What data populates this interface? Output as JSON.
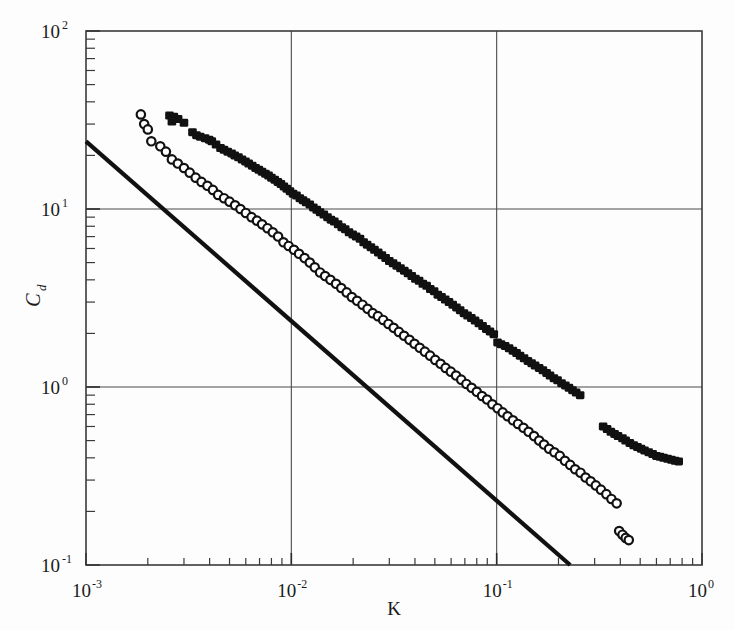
{
  "chart_data": {
    "type": "scatter",
    "title": "",
    "xlabel": "K",
    "ylabel": "Cd",
    "ylabel_base": "C",
    "ylabel_sub": "d",
    "xscale": "log",
    "yscale": "log",
    "xlim": [
      0.001,
      1.0
    ],
    "ylim": [
      0.1,
      100
    ],
    "grid": true,
    "grid_x_values": [
      0.01,
      0.1
    ],
    "grid_y_values": [
      10,
      1
    ],
    "legend": "none",
    "xticks": [
      {
        "value": 0.001,
        "base": "10",
        "exp": "-3"
      },
      {
        "value": 0.01,
        "base": "10",
        "exp": "-2"
      },
      {
        "value": 0.1,
        "base": "10",
        "exp": "-1"
      },
      {
        "value": 1.0,
        "base": "10",
        "exp": "0"
      }
    ],
    "yticks": [
      {
        "value": 100,
        "base": "10",
        "exp": "2"
      },
      {
        "value": 10,
        "base": "10",
        "exp": "1"
      },
      {
        "value": 1,
        "base": "10",
        "exp": "0"
      },
      {
        "value": 0.1,
        "base": "10",
        "exp": "-1"
      }
    ],
    "series": [
      {
        "name": "filled-squares",
        "marker": "filled-square",
        "color": "#111111",
        "points": [
          [
            0.00255,
            33.5
          ],
          [
            0.00268,
            33.0
          ],
          [
            0.00281,
            32.0
          ],
          [
            0.00262,
            31.0
          ],
          [
            0.003,
            30.5
          ],
          [
            0.0033,
            27.0
          ],
          [
            0.00345,
            26.0
          ],
          [
            0.0036,
            25.5
          ],
          [
            0.0038,
            25.0
          ],
          [
            0.00398,
            24.5
          ],
          [
            0.0041,
            24.0
          ],
          [
            0.0043,
            23.0
          ],
          [
            0.00452,
            22.0
          ],
          [
            0.0047,
            21.5
          ],
          [
            0.0049,
            21.0
          ],
          [
            0.00512,
            20.5
          ],
          [
            0.0053,
            20.0
          ],
          [
            0.00553,
            19.5
          ],
          [
            0.00575,
            19.0
          ],
          [
            0.00598,
            18.5
          ],
          [
            0.0062,
            18.0
          ],
          [
            0.00645,
            17.5
          ],
          [
            0.0067,
            17.0
          ],
          [
            0.00695,
            16.6
          ],
          [
            0.0072,
            16.2
          ],
          [
            0.00748,
            15.8
          ],
          [
            0.00775,
            15.4
          ],
          [
            0.008,
            15.0
          ],
          [
            0.0083,
            14.6
          ],
          [
            0.0086,
            14.2
          ],
          [
            0.0089,
            13.8
          ],
          [
            0.0092,
            13.4
          ],
          [
            0.0095,
            13.0
          ],
          [
            0.00985,
            12.6
          ],
          [
            0.0102,
            12.2
          ],
          [
            0.0106,
            11.9
          ],
          [
            0.011,
            11.5
          ],
          [
            0.0114,
            11.2
          ],
          [
            0.0118,
            10.9
          ],
          [
            0.0123,
            10.6
          ],
          [
            0.0128,
            10.2
          ],
          [
            0.0133,
            9.9
          ],
          [
            0.0138,
            9.6
          ],
          [
            0.0144,
            9.3
          ],
          [
            0.015,
            9.0
          ],
          [
            0.0156,
            8.7
          ],
          [
            0.0162,
            8.5
          ],
          [
            0.0169,
            8.2
          ],
          [
            0.0176,
            7.9
          ],
          [
            0.0183,
            7.7
          ],
          [
            0.0191,
            7.4
          ],
          [
            0.0199,
            7.2
          ],
          [
            0.0207,
            7.0
          ],
          [
            0.0216,
            6.8
          ],
          [
            0.0225,
            6.5
          ],
          [
            0.0234,
            6.3
          ],
          [
            0.0244,
            6.1
          ],
          [
            0.0254,
            5.9
          ],
          [
            0.0265,
            5.7
          ],
          [
            0.0276,
            5.5
          ],
          [
            0.0288,
            5.3
          ],
          [
            0.03,
            5.1
          ],
          [
            0.0313,
            4.95
          ],
          [
            0.0326,
            4.8
          ],
          [
            0.034,
            4.65
          ],
          [
            0.0355,
            4.5
          ],
          [
            0.037,
            4.35
          ],
          [
            0.0386,
            4.2
          ],
          [
            0.0402,
            4.05
          ],
          [
            0.0419,
            3.95
          ],
          [
            0.0437,
            3.8
          ],
          [
            0.0456,
            3.7
          ],
          [
            0.0475,
            3.55
          ],
          [
            0.0496,
            3.45
          ],
          [
            0.0517,
            3.3
          ],
          [
            0.0539,
            3.2
          ],
          [
            0.0562,
            3.1
          ],
          [
            0.0586,
            3.0
          ],
          [
            0.0611,
            2.9
          ],
          [
            0.0637,
            2.8
          ],
          [
            0.0664,
            2.7
          ],
          [
            0.0693,
            2.6
          ],
          [
            0.0722,
            2.52
          ],
          [
            0.0753,
            2.44
          ],
          [
            0.0785,
            2.36
          ],
          [
            0.0819,
            2.28
          ],
          [
            0.0854,
            2.2
          ],
          [
            0.089,
            2.12
          ],
          [
            0.0928,
            2.05
          ],
          [
            0.0968,
            1.98
          ],
          [
            0.101,
            1.78
          ],
          [
            0.105,
            1.74
          ],
          [
            0.11,
            1.7
          ],
          [
            0.115,
            1.65
          ],
          [
            0.12,
            1.6
          ],
          [
            0.125,
            1.55
          ],
          [
            0.13,
            1.5
          ],
          [
            0.136,
            1.45
          ],
          [
            0.142,
            1.4
          ],
          [
            0.148,
            1.36
          ],
          [
            0.154,
            1.32
          ],
          [
            0.161,
            1.28
          ],
          [
            0.168,
            1.24
          ],
          [
            0.175,
            1.2
          ],
          [
            0.182,
            1.16
          ],
          [
            0.19,
            1.12
          ],
          [
            0.198,
            1.09
          ],
          [
            0.207,
            1.05
          ],
          [
            0.216,
            1.02
          ],
          [
            0.225,
            0.99
          ],
          [
            0.234,
            0.96
          ],
          [
            0.244,
            0.93
          ],
          [
            0.255,
            0.9
          ],
          [
            0.33,
            0.6
          ],
          [
            0.345,
            0.58
          ],
          [
            0.36,
            0.56
          ],
          [
            0.375,
            0.545
          ],
          [
            0.39,
            0.53
          ],
          [
            0.41,
            0.515
          ],
          [
            0.425,
            0.5
          ],
          [
            0.445,
            0.485
          ],
          [
            0.465,
            0.47
          ],
          [
            0.485,
            0.46
          ],
          [
            0.505,
            0.45
          ],
          [
            0.525,
            0.44
          ],
          [
            0.55,
            0.43
          ],
          [
            0.575,
            0.42
          ],
          [
            0.6,
            0.41
          ],
          [
            0.625,
            0.405
          ],
          [
            0.65,
            0.4
          ],
          [
            0.68,
            0.395
          ],
          [
            0.71,
            0.39
          ],
          [
            0.74,
            0.385
          ],
          [
            0.77,
            0.382
          ]
        ]
      },
      {
        "name": "open-circles",
        "marker": "open-circle",
        "color": "#111111",
        "points": [
          [
            0.00185,
            34.0
          ],
          [
            0.00192,
            30.0
          ],
          [
            0.002,
            28.0
          ],
          [
            0.00208,
            24.0
          ],
          [
            0.0023,
            22.5
          ],
          [
            0.00245,
            21.0
          ],
          [
            0.00262,
            19.0
          ],
          [
            0.0028,
            18.0
          ],
          [
            0.003,
            17.0
          ],
          [
            0.0032,
            16.0
          ],
          [
            0.00342,
            15.0
          ],
          [
            0.00365,
            14.2
          ],
          [
            0.0039,
            13.5
          ],
          [
            0.00415,
            12.8
          ],
          [
            0.0044,
            12.0
          ],
          [
            0.0047,
            11.5
          ],
          [
            0.005,
            11.0
          ],
          [
            0.00532,
            10.5
          ],
          [
            0.00565,
            10.0
          ],
          [
            0.006,
            9.5
          ],
          [
            0.0064,
            9.0
          ],
          [
            0.0068,
            8.6
          ],
          [
            0.0072,
            8.2
          ],
          [
            0.00765,
            7.8
          ],
          [
            0.00812,
            7.4
          ],
          [
            0.00862,
            7.0
          ],
          [
            0.00915,
            6.5
          ],
          [
            0.0097,
            6.2
          ],
          [
            0.0103,
            5.9
          ],
          [
            0.0109,
            5.6
          ],
          [
            0.0116,
            5.3
          ],
          [
            0.0123,
            5.0
          ],
          [
            0.013,
            4.7
          ],
          [
            0.0138,
            4.4
          ],
          [
            0.0146,
            4.2
          ],
          [
            0.0155,
            4.0
          ],
          [
            0.0165,
            3.8
          ],
          [
            0.0175,
            3.6
          ],
          [
            0.0186,
            3.4
          ],
          [
            0.0197,
            3.2
          ],
          [
            0.0209,
            3.05
          ],
          [
            0.0222,
            2.9
          ],
          [
            0.0235,
            2.75
          ],
          [
            0.0249,
            2.6
          ],
          [
            0.0264,
            2.5
          ],
          [
            0.028,
            2.38
          ],
          [
            0.0297,
            2.26
          ],
          [
            0.0315,
            2.15
          ],
          [
            0.0334,
            2.04
          ],
          [
            0.0354,
            1.94
          ],
          [
            0.0376,
            1.84
          ],
          [
            0.0398,
            1.75
          ],
          [
            0.0422,
            1.66
          ],
          [
            0.0447,
            1.58
          ],
          [
            0.0474,
            1.5
          ],
          [
            0.0502,
            1.42
          ],
          [
            0.0533,
            1.35
          ],
          [
            0.0564,
            1.28
          ],
          [
            0.0598,
            1.22
          ],
          [
            0.0634,
            1.16
          ],
          [
            0.0672,
            1.1
          ],
          [
            0.0712,
            1.04
          ],
          [
            0.0755,
            0.99
          ],
          [
            0.08,
            0.94
          ],
          [
            0.0848,
            0.89
          ],
          [
            0.0898,
            0.85
          ],
          [
            0.0952,
            0.8
          ],
          [
            0.101,
            0.76
          ],
          [
            0.107,
            0.72
          ],
          [
            0.113,
            0.685
          ],
          [
            0.12,
            0.65
          ],
          [
            0.127,
            0.62
          ],
          [
            0.135,
            0.59
          ],
          [
            0.143,
            0.56
          ],
          [
            0.152,
            0.53
          ],
          [
            0.161,
            0.5
          ],
          [
            0.17,
            0.475
          ],
          [
            0.18,
            0.45
          ],
          [
            0.191,
            0.43
          ],
          [
            0.203,
            0.41
          ],
          [
            0.215,
            0.385
          ],
          [
            0.228,
            0.365
          ],
          [
            0.241,
            0.345
          ],
          [
            0.256,
            0.33
          ],
          [
            0.271,
            0.31
          ],
          [
            0.287,
            0.295
          ],
          [
            0.304,
            0.28
          ],
          [
            0.322,
            0.265
          ],
          [
            0.342,
            0.25
          ],
          [
            0.362,
            0.235
          ],
          [
            0.384,
            0.222
          ],
          [
            0.395,
            0.155
          ],
          [
            0.41,
            0.148
          ],
          [
            0.425,
            0.142
          ],
          [
            0.44,
            0.138
          ]
        ]
      }
    ],
    "reference_line": {
      "name": "power-law-line",
      "color": "#111111",
      "start": [
        0.001,
        24.0
      ],
      "end": [
        0.228,
        0.1
      ],
      "slope": -1.0
    }
  }
}
